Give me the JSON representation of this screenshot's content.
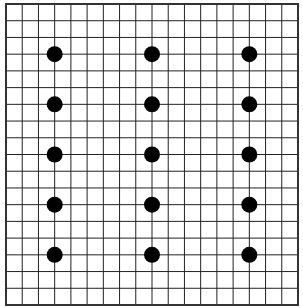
{
  "board": {
    "left": 6,
    "top": 4,
    "right": 298,
    "bottom": 305,
    "cols": 18,
    "rows": 18,
    "line_color": "#222222",
    "border_color": "#333333",
    "background": "#ffffff"
  },
  "dots": {
    "color": "#000000",
    "radius": 8,
    "positions": [
      {
        "col": 3,
        "row": 3
      },
      {
        "col": 9,
        "row": 3
      },
      {
        "col": 15,
        "row": 3
      },
      {
        "col": 3,
        "row": 6
      },
      {
        "col": 9,
        "row": 6
      },
      {
        "col": 15,
        "row": 6
      },
      {
        "col": 3,
        "row": 9
      },
      {
        "col": 9,
        "row": 9
      },
      {
        "col": 15,
        "row": 9
      },
      {
        "col": 3,
        "row": 12
      },
      {
        "col": 9,
        "row": 12
      },
      {
        "col": 15,
        "row": 12
      },
      {
        "col": 3,
        "row": 15
      },
      {
        "col": 9,
        "row": 15
      },
      {
        "col": 15,
        "row": 15
      }
    ]
  }
}
